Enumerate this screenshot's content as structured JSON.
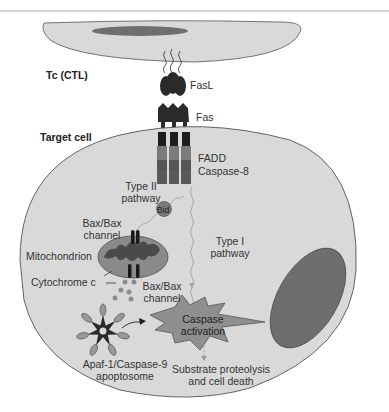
{
  "figure": {
    "cells": {
      "tc_cell": "Tc (CTL)",
      "target_cell": "Target cell"
    },
    "molecules": {
      "fasl": "FasL",
      "fas": "Fas",
      "fadd": "FADD",
      "caspase8": "Caspase-8",
      "bid": "Bid",
      "cytochrome_c": "Cytochrome c"
    },
    "pathways": {
      "type2_line1": "Type II",
      "type2_line2": "pathway",
      "type1_line1": "Type I",
      "type1_line2": "pathway"
    },
    "organelles": {
      "bax_top_line1": "Bax/Bax",
      "bax_top_line2": "channel",
      "mitochondrion": "Mitochondrion",
      "bax_bottom_line1": "Bax/Bax",
      "bax_bottom_line2": "channel"
    },
    "outcomes": {
      "caspase_line1": "Caspase",
      "caspase_line2": "activation",
      "apaf_line1": "Apaf-1/Caspase-9",
      "apaf_line2": "apoptosome",
      "death_line1": "Substrate proteolysis",
      "death_line2": "and cell death"
    },
    "colors": {
      "cell_fill": "#d9d9d9",
      "nucleus_fill": "#6e6e6e",
      "protein_dark": "#2a2a2a",
      "caspase_fill": "#8f8f8f",
      "mito_outer": "#8a8a8a",
      "mito_inner": "#4a4a4a",
      "cyt_c": "#8c8c8c",
      "pathway_arrow": "#a8a8a8"
    }
  }
}
